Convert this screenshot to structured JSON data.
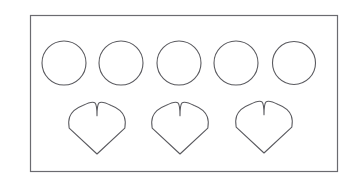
{
  "document": {
    "title": "Shapes Worksheet",
    "background_color": "#ffffff"
  },
  "frame": {
    "name": "worksheet-border",
    "x": 30.5,
    "y": 15.5,
    "width": 307,
    "height": 156,
    "stroke_color": "#6b6b70",
    "stroke_width": 1.2,
    "fill": "none"
  },
  "shapes": {
    "stroke_color": "#5a5a5f",
    "stroke_width": 1.1,
    "fill": "none",
    "rows": [
      {
        "name": "circle-row",
        "shape_type": "circle",
        "count": 5,
        "radius": 22,
        "center_y": 63,
        "items": [
          {
            "label": "circle-1",
            "cx": 64,
            "cy": 63,
            "r": 22
          },
          {
            "label": "circle-2",
            "cx": 121,
            "cy": 63,
            "r": 22
          },
          {
            "label": "circle-3",
            "cx": 179,
            "cy": 63,
            "r": 22
          },
          {
            "label": "circle-4",
            "cx": 236,
            "cy": 63,
            "r": 22
          },
          {
            "label": "circle-5",
            "cx": 294,
            "cy": 63,
            "r": 21.5
          }
        ]
      },
      {
        "name": "heart-row",
        "shape_type": "heart",
        "count": 3,
        "width": 57,
        "height": 50,
        "top_y": 104,
        "items": [
          {
            "label": "heart-1",
            "cx": 97,
            "top": 105,
            "w": 57,
            "h": 49
          },
          {
            "label": "heart-2",
            "cx": 180,
            "top": 105,
            "w": 57,
            "h": 49
          },
          {
            "label": "heart-3",
            "cx": 264,
            "top": 104,
            "w": 57,
            "h": 49
          }
        ]
      }
    ]
  }
}
